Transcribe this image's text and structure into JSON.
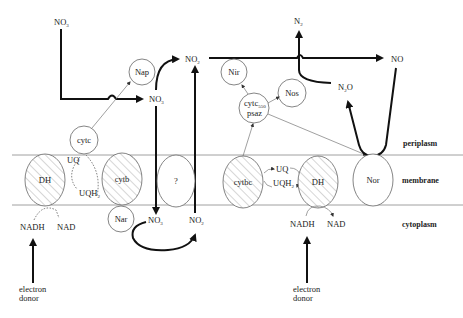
{
  "diagram": {
    "type": "denitrification electron transport pathway",
    "compartments": {
      "periplasm": "periplasm",
      "membrane": "membrane",
      "cytoplasm": "cytoplasm"
    },
    "left_system": {
      "nitrate_top": {
        "base": "NO",
        "sub": "3"
      },
      "nap": "Nap",
      "nitrate_mid": {
        "base": "NO",
        "sub": "3"
      },
      "nitrite_top": {
        "base": "NO",
        "sub": "2"
      },
      "cytc": "cytc",
      "dh": "DH",
      "uq": "UQ",
      "uqh2": {
        "base": "UQH",
        "sub": "2"
      },
      "cytb": "cytb",
      "unknown": "?",
      "nar": "Nar",
      "nitrate_cyto": {
        "base": "NO",
        "sub": "3"
      },
      "nitrite_cyto": {
        "base": "NO",
        "sub": "2"
      },
      "nadh": "NADH",
      "nad": "NAD",
      "electron_donor": [
        "electron",
        "donor"
      ]
    },
    "right_system": {
      "n2": {
        "base": "N",
        "sub": "2"
      },
      "no": "NO",
      "nir": "Nir",
      "nos": "Nos",
      "n2o": {
        "base": "N",
        "sub": "2",
        "tail": "O"
      },
      "cytc_psaz": {
        "base": "cytc",
        "sub": "550",
        "line2": "psaz"
      },
      "cytbc": "cytbc",
      "uq": "UQ",
      "uqh2": {
        "base": "UQH",
        "sub": "2"
      },
      "dh": "DH",
      "nor": "Nor",
      "nadh": "NADH",
      "nad": "NAD",
      "electron_donor": [
        "electron",
        "donor"
      ]
    }
  }
}
